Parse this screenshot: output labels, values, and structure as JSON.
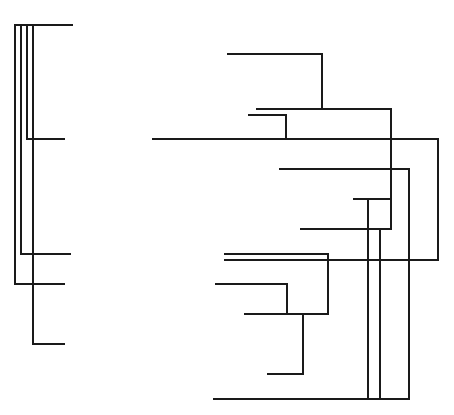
{
  "diagram": {
    "type": "dendrogram-line-drawing",
    "stroke_color": "#1a1a1a",
    "background": "#ffffff",
    "left_tree": {
      "segments": [
        [
          15,
          25,
          72,
          25
        ],
        [
          15,
          25,
          15,
          284
        ],
        [
          21,
          25,
          21,
          254
        ],
        [
          27,
          25,
          27,
          139
        ],
        [
          33,
          25,
          33,
          344
        ],
        [
          27,
          139,
          64,
          139
        ],
        [
          21,
          254,
          70,
          254
        ],
        [
          15,
          284,
          64,
          284
        ],
        [
          33,
          344,
          64,
          344
        ]
      ]
    },
    "right_tree": {
      "segments": [
        [
          228,
          54,
          322,
          54
        ],
        [
          322,
          54,
          322,
          109
        ],
        [
          257,
          109,
          391,
          109
        ],
        [
          249,
          115,
          286,
          115
        ],
        [
          286,
          115,
          286,
          139
        ],
        [
          153,
          139,
          438,
          139
        ],
        [
          438,
          139,
          438,
          260
        ],
        [
          280,
          169,
          409,
          169
        ],
        [
          409,
          169,
          409,
          399
        ],
        [
          391,
          109,
          391,
          229
        ],
        [
          354,
          199,
          391,
          199
        ],
        [
          368,
          199,
          368,
          399
        ],
        [
          301,
          229,
          391,
          229
        ],
        [
          380,
          229,
          380,
          399
        ],
        [
          225,
          254,
          328,
          254
        ],
        [
          225,
          260,
          438,
          260
        ],
        [
          328,
          254,
          328,
          314
        ],
        [
          216,
          284,
          287,
          284
        ],
        [
          287,
          284,
          287,
          314
        ],
        [
          245,
          314,
          328,
          314
        ],
        [
          303,
          314,
          303,
          374
        ],
        [
          268,
          374,
          303,
          374
        ],
        [
          214,
          399,
          409,
          399
        ]
      ]
    }
  }
}
